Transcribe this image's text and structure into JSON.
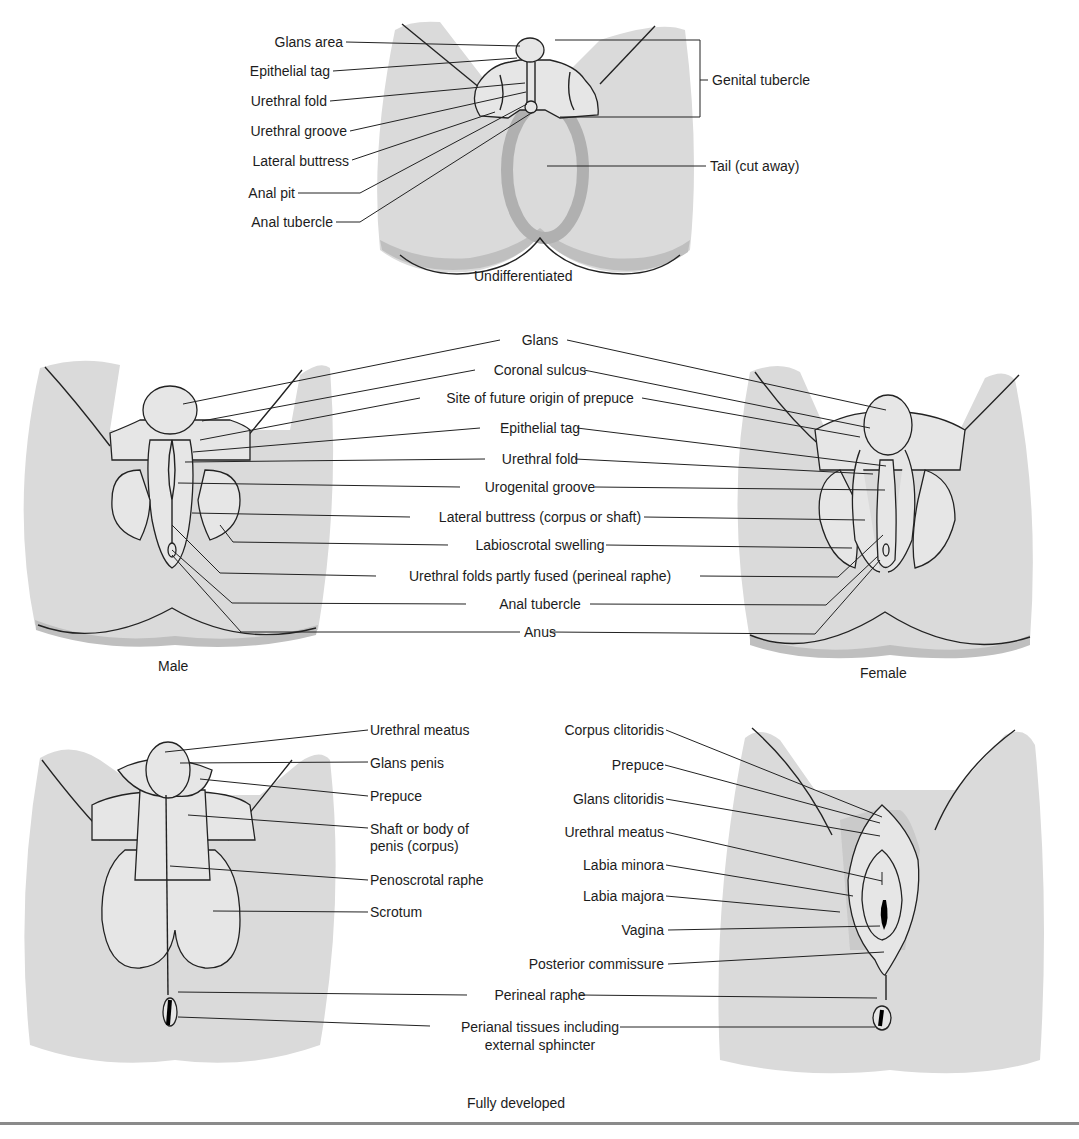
{
  "figure": {
    "panels": {
      "undifferentiated": {
        "caption": "Undifferentiated",
        "labels": [
          "Glans area",
          "Epithelial tag",
          "Urethral fold",
          "Urethral groove",
          "Lateral buttress",
          "Anal pit",
          "Anal tubercle"
        ],
        "right_labels": [
          "Genital tubercle",
          "Tail (cut away)"
        ]
      },
      "intermediate": {
        "male_caption": "Male",
        "female_caption": "Female",
        "labels": [
          "Glans",
          "Coronal sulcus",
          "Site of future origin of prepuce",
          "Epithelial tag",
          "Urethral fold",
          "Urogenital groove",
          "Lateral buttress (corpus or shaft)",
          "Labioscrotal swelling",
          "Urethral folds partly fused (perineal raphe)",
          "Anal tubercle",
          "Anus"
        ]
      },
      "fully_developed": {
        "caption": "Fully developed",
        "male_labels": [
          "Urethral meatus",
          "Glans penis",
          "Prepuce",
          "Shaft or body of",
          "penis (corpus)",
          "Penoscrotal raphe",
          "Scrotum"
        ],
        "female_labels": [
          "Corpus clitoridis",
          "Prepuce",
          "Glans clitoridis",
          "Urethral meatus",
          "Labia minora",
          "Labia majora",
          "Vagina",
          "Posterior commissure"
        ],
        "shared_labels": [
          "Perineal raphe",
          "Perianal tissues including",
          "external sphincter"
        ]
      }
    },
    "colors": {
      "skin_fill": "#d9d9d9",
      "shadow_fill": "#bdbdbd",
      "line": "#222222",
      "rule": "#8a8a8a"
    }
  }
}
